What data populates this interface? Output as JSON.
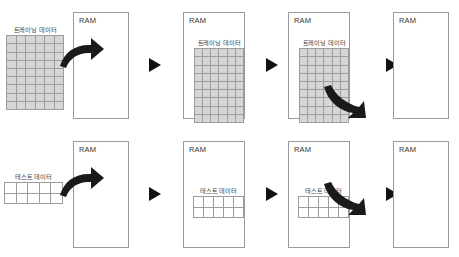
{
  "figure": {
    "title": "",
    "background_color": "#ffffff",
    "width": 459,
    "height": 257
  },
  "colors": {
    "box_border": "#9a9a9a",
    "grid_border": "#9d9d9d",
    "training_cell_fill": "#d6d6d6",
    "test_cell_fill": "#ffffff",
    "arrow_fill": "#1a1a1a",
    "label_text": "#333333"
  },
  "labels": {
    "ram": "RAM",
    "training_data": "트레이닝 데이터",
    "test_data": "테스트 데이터"
  },
  "rows": [
    {
      "name": "training-row",
      "data_label": "트레이닝 데이터",
      "grid": {
        "columns": 6,
        "rows": 9,
        "fill": "filled"
      },
      "steps": [
        {
          "step": 1,
          "ram_label": "RAM",
          "data_position": "outside-left",
          "arrow": "load-in",
          "separator": "play-triangle"
        },
        {
          "step": 2,
          "ram_label": "RAM",
          "data_position": "inside",
          "arrow": "none",
          "separator": "play-triangle"
        },
        {
          "step": 3,
          "ram_label": "RAM",
          "data_position": "inside",
          "arrow": "unload-out",
          "separator": "play-triangle"
        },
        {
          "step": 4,
          "ram_label": "RAM",
          "data_position": "none",
          "arrow": "none",
          "separator": "none"
        }
      ]
    },
    {
      "name": "test-row",
      "data_label": "테스트 데이터",
      "grid": {
        "columns": 5,
        "rows": 2,
        "fill": "empty"
      },
      "steps": [
        {
          "step": 1,
          "ram_label": "RAM",
          "data_position": "outside-left",
          "arrow": "load-in",
          "separator": "play-triangle"
        },
        {
          "step": 2,
          "ram_label": "RAM",
          "data_position": "inside",
          "arrow": "none",
          "separator": "play-triangle"
        },
        {
          "step": 3,
          "ram_label": "RAM",
          "data_position": "inside",
          "arrow": "unload-out",
          "separator": "play-triangle"
        },
        {
          "step": 4,
          "ram_label": "RAM",
          "data_position": "none",
          "arrow": "none",
          "separator": "none"
        }
      ]
    }
  ]
}
